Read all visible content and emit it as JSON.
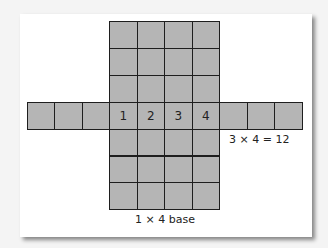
{
  "diagram": {
    "cell_color": "#b5b5b5",
    "border_color": "#1e1e1e",
    "base_numbers": [
      "1",
      "2",
      "3",
      "4"
    ],
    "labels": {
      "side_area": "3 × 4 = 12",
      "base": "1 × 4 base"
    },
    "grid": {
      "vertical_columns": 4,
      "vertical_rows": 7,
      "side_strip_cells_each": 3,
      "strip_row_index": 3
    }
  }
}
